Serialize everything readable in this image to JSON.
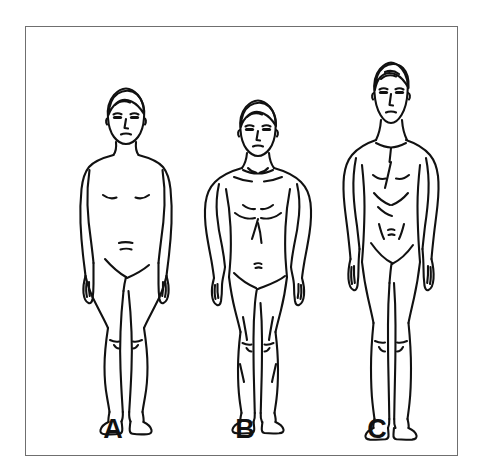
{
  "illustration": {
    "title": "Somatotype body type comparison",
    "frame": {
      "border_color": "#6f6f6f",
      "background": "#ffffff",
      "x": 25,
      "y": 26,
      "width": 433,
      "height": 430
    },
    "line_color": "#111111",
    "figures": [
      {
        "label": "A",
        "somatotype": "endomorph",
        "description": "rounded soft build, narrow shoulders, wider waist and hips",
        "label_x": 113,
        "label_y": 416,
        "head_top_y": 90,
        "feet_bottom_y": 408,
        "shoulder_left_x": 82,
        "shoulder_right_x": 150,
        "center_x": 114
      },
      {
        "label": "B",
        "somatotype": "mesomorph",
        "description": "muscular athletic build, broad shoulders, narrow waist",
        "label_x": 245,
        "label_y": 416,
        "head_top_y": 100,
        "feet_bottom_y": 406,
        "shoulder_left_x": 206,
        "shoulder_right_x": 286,
        "center_x": 246
      },
      {
        "label": "C",
        "somatotype": "ectomorph",
        "description": "tall slender build, long limbs, little muscle or fat",
        "label_x": 377,
        "label_y": 416,
        "head_top_y": 62,
        "feet_bottom_y": 413,
        "shoulder_left_x": 338,
        "shoulder_right_x": 414,
        "center_x": 377
      }
    ]
  }
}
